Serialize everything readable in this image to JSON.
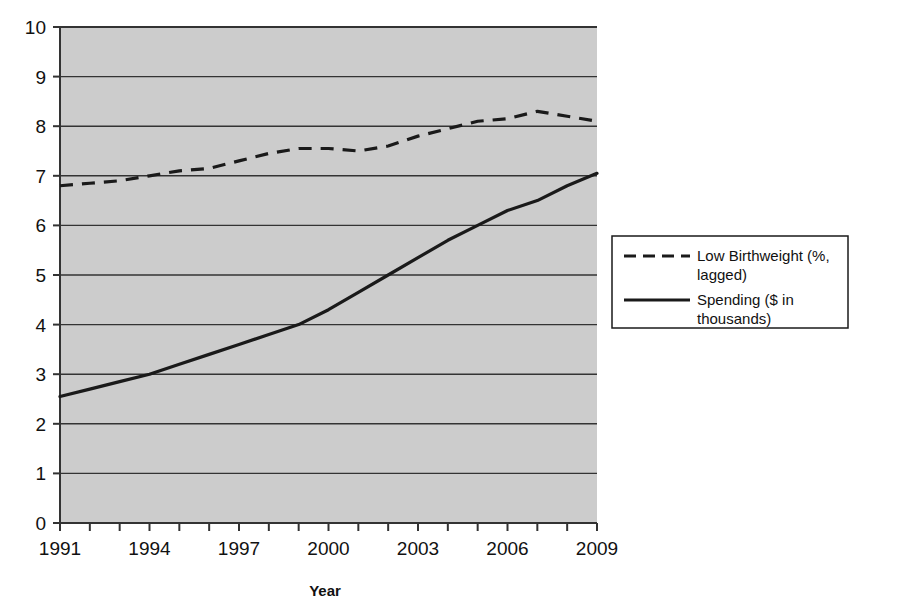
{
  "chart_data": {
    "type": "line",
    "title": "",
    "xlabel": "Year",
    "ylabel": "",
    "grid": true,
    "legend_position": "right",
    "xlim": [
      1991,
      2009
    ],
    "ylim": [
      0,
      10
    ],
    "x": [
      1991,
      1992,
      1993,
      1994,
      1995,
      1996,
      1997,
      1998,
      1999,
      2000,
      2001,
      2002,
      2003,
      2004,
      2005,
      2006,
      2007,
      2008,
      2009
    ],
    "xtick_labels": [
      "1991",
      "1994",
      "1997",
      "2000",
      "2003",
      "2006",
      "2009"
    ],
    "ytick_labels": [
      "0",
      "1",
      "2",
      "3",
      "4",
      "5",
      "6",
      "7",
      "8",
      "9",
      "10"
    ],
    "series": [
      {
        "name": "Low Birthweight (%, lagged)",
        "style": "dashed",
        "color": "#1a1a1a",
        "values": [
          6.8,
          6.85,
          6.9,
          7.0,
          7.1,
          7.15,
          7.3,
          7.45,
          7.55,
          7.55,
          7.5,
          7.6,
          7.8,
          7.95,
          8.1,
          8.15,
          8.3,
          8.2,
          8.1
        ]
      },
      {
        "name": "Spending ($ in thousands)",
        "style": "solid",
        "color": "#1a1a1a",
        "values": [
          2.55,
          2.7,
          2.85,
          3.0,
          3.2,
          3.4,
          3.6,
          3.8,
          4.0,
          4.3,
          4.65,
          5.0,
          5.35,
          5.7,
          6.0,
          6.3,
          6.5,
          6.8,
          7.05
        ]
      }
    ]
  },
  "figure": {
    "plot_background": "#cccccc",
    "gridline_color": "#333333",
    "axis_color": "#333333",
    "legend_border": "#1a1a1a",
    "legend_background": "#ffffff"
  },
  "legend": {
    "entries": [
      {
        "label_line1": "Low Birthweight (%,",
        "label_line2": "lagged)",
        "style": "dashed"
      },
      {
        "label_line1": "Spending ($ in",
        "label_line2": "thousands)",
        "style": "solid"
      }
    ]
  }
}
